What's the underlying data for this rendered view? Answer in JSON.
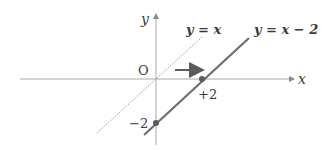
{
  "diagram": {
    "type": "coordinate-plane-translation",
    "axes": {
      "x_label": "x",
      "y_label": "y",
      "origin_label": "O"
    },
    "lines": [
      {
        "name": "y=x",
        "label": "y = x",
        "style": "dotted",
        "color": "#9a9a9a",
        "slope": 1,
        "intercept": 0
      },
      {
        "name": "y=x-2",
        "label": "y = x − 2",
        "style": "solid",
        "color": "#6e6e6e",
        "slope": 1,
        "intercept": -2
      }
    ],
    "points": [
      {
        "label": "+2",
        "x": 2,
        "y": 0
      },
      {
        "label": "−2",
        "x": 0,
        "y": -2
      }
    ],
    "annotation": {
      "arrow": "translate right by 2",
      "direction": "right"
    },
    "colors": {
      "axis": "#a8a8a8",
      "solid_line": "#6e6e6e",
      "dotted_line": "#9a9a9a",
      "point": "#5a5a5a",
      "arrow": "#5a5a5a",
      "text": "#3a3a3a"
    }
  }
}
